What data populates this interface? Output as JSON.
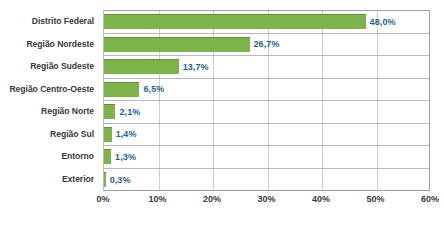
{
  "chart_data": {
    "type": "bar",
    "orientation": "horizontal",
    "title": "",
    "subtitle": "",
    "xlabel": "",
    "ylabel": "",
    "categories": [
      "Distrito Federal",
      "Região Nordeste",
      "Região Sudeste",
      "Região Centro-Oeste",
      "Região Norte",
      "Região Sul",
      "Entorno",
      "Exterior"
    ],
    "values": [
      48.0,
      26.7,
      13.7,
      6.5,
      2.1,
      1.4,
      1.3,
      0.3
    ],
    "value_labels": [
      "48,0%",
      "26,7%",
      "13,7%",
      "6,5%",
      "2,1%",
      "1,4%",
      "1,3%",
      "0,3%"
    ],
    "xlim": [
      0,
      60
    ],
    "xticks": [
      0,
      10,
      20,
      30,
      40,
      50,
      60
    ],
    "xtick_labels": [
      "0%",
      "10%",
      "20%",
      "30%",
      "40%",
      "50%",
      "60%"
    ],
    "grid": "vertical-and-row-separators",
    "legend": "none",
    "bar_color": "#7db34a",
    "bar_edge_color": "#5f9433",
    "value_label_color": "#2e5f8a",
    "category_label_color": "#3a3a3a",
    "gridline_color": "#c9ced3",
    "axis_color": "#9aa0a6",
    "background": "#ffffff"
  },
  "source_note": ""
}
